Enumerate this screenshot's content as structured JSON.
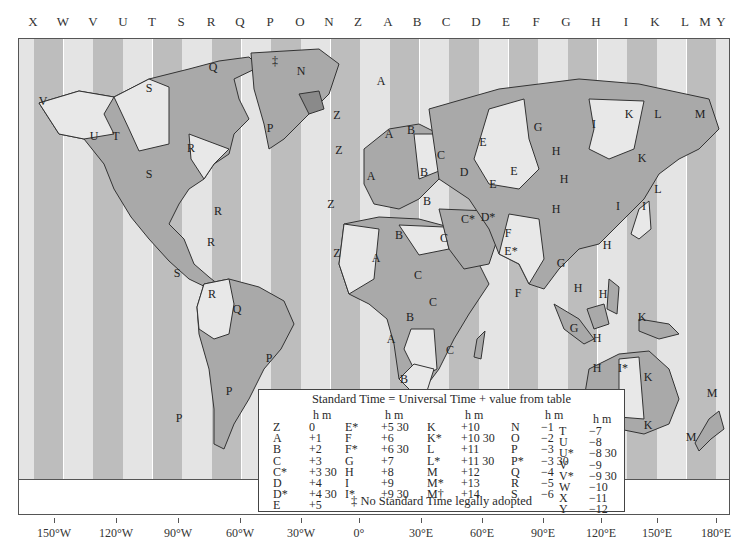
{
  "zone_letters": [
    {
      "letter": "X",
      "x": 33
    },
    {
      "letter": "W",
      "x": 63
    },
    {
      "letter": "V",
      "x": 93
    },
    {
      "letter": "U",
      "x": 123
    },
    {
      "letter": "T",
      "x": 152
    },
    {
      "letter": "S",
      "x": 181
    },
    {
      "letter": "R",
      "x": 211
    },
    {
      "letter": "Q",
      "x": 240
    },
    {
      "letter": "P",
      "x": 270
    },
    {
      "letter": "O",
      "x": 300
    },
    {
      "letter": "N",
      "x": 329
    },
    {
      "letter": "Z",
      "x": 358
    },
    {
      "letter": "A",
      "x": 388
    },
    {
      "letter": "B",
      "x": 417
    },
    {
      "letter": "C",
      "x": 446
    },
    {
      "letter": "D",
      "x": 476
    },
    {
      "letter": "E",
      "x": 506
    },
    {
      "letter": "F",
      "x": 536
    },
    {
      "letter": "G",
      "x": 566
    },
    {
      "letter": "H",
      "x": 596
    },
    {
      "letter": "I",
      "x": 626
    },
    {
      "letter": "K",
      "x": 655
    },
    {
      "letter": "L",
      "x": 685
    },
    {
      "letter": "M",
      "x": 705
    },
    {
      "letter": "Y",
      "x": 721
    }
  ],
  "colors": {
    "stripe_light": "#e4e4e4",
    "stripe_dark": "#bdbdbd",
    "land_dark": "#a9a9a9",
    "land_light": "#e8e8e8",
    "border": "#555555"
  },
  "land_labels": [
    {
      "t": "V",
      "x": 42,
      "y": 100
    },
    {
      "t": "U",
      "x": 93,
      "y": 135
    },
    {
      "t": "T",
      "x": 115,
      "y": 135
    },
    {
      "t": "S",
      "x": 148,
      "y": 87
    },
    {
      "t": "S",
      "x": 148,
      "y": 173
    },
    {
      "t": "R",
      "x": 190,
      "y": 147
    },
    {
      "t": "Q",
      "x": 212,
      "y": 66
    },
    {
      "t": "R",
      "x": 217,
      "y": 210
    },
    {
      "t": "R",
      "x": 210,
      "y": 241
    },
    {
      "t": "S",
      "x": 176,
      "y": 272
    },
    {
      "t": "R",
      "x": 211,
      "y": 293
    },
    {
      "t": "Q",
      "x": 236,
      "y": 308
    },
    {
      "t": "P",
      "x": 228,
      "y": 390
    },
    {
      "t": "P",
      "x": 268,
      "y": 357
    },
    {
      "t": "P",
      "x": 178,
      "y": 417
    },
    {
      "t": "‡",
      "x": 274,
      "y": 60
    },
    {
      "t": "N",
      "x": 300,
      "y": 70
    },
    {
      "t": "P",
      "x": 269,
      "y": 127
    },
    {
      "t": "A",
      "x": 380,
      "y": 80
    },
    {
      "t": "Z",
      "x": 336,
      "y": 114
    },
    {
      "t": "Z",
      "x": 338,
      "y": 149
    },
    {
      "t": "A",
      "x": 388,
      "y": 133
    },
    {
      "t": "B",
      "x": 410,
      "y": 129
    },
    {
      "t": "C",
      "x": 440,
      "y": 154
    },
    {
      "t": "E",
      "x": 482,
      "y": 141
    },
    {
      "t": "D",
      "x": 463,
      "y": 171
    },
    {
      "t": "E",
      "x": 492,
      "y": 183
    },
    {
      "t": "A",
      "x": 370,
      "y": 175
    },
    {
      "t": "B",
      "x": 423,
      "y": 171
    },
    {
      "t": "B",
      "x": 426,
      "y": 200
    },
    {
      "t": "Z",
      "x": 330,
      "y": 203
    },
    {
      "t": "C*",
      "x": 467,
      "y": 218
    },
    {
      "t": "D*",
      "x": 487,
      "y": 216
    },
    {
      "t": "C",
      "x": 443,
      "y": 237
    },
    {
      "t": "B",
      "x": 398,
      "y": 234
    },
    {
      "t": "Z",
      "x": 336,
      "y": 252
    },
    {
      "t": "A",
      "x": 375,
      "y": 257
    },
    {
      "t": "C",
      "x": 417,
      "y": 274
    },
    {
      "t": "C",
      "x": 432,
      "y": 301
    },
    {
      "t": "B",
      "x": 409,
      "y": 316
    },
    {
      "t": "A",
      "x": 390,
      "y": 338
    },
    {
      "t": "C",
      "x": 449,
      "y": 349
    },
    {
      "t": "B",
      "x": 403,
      "y": 378
    },
    {
      "t": "E",
      "x": 513,
      "y": 170
    },
    {
      "t": "F",
      "x": 507,
      "y": 232
    },
    {
      "t": "G",
      "x": 537,
      "y": 126
    },
    {
      "t": "H",
      "x": 555,
      "y": 150
    },
    {
      "t": "H",
      "x": 563,
      "y": 178
    },
    {
      "t": "I",
      "x": 593,
      "y": 123
    },
    {
      "t": "K",
      "x": 628,
      "y": 113
    },
    {
      "t": "L",
      "x": 657,
      "y": 113
    },
    {
      "t": "M",
      "x": 699,
      "y": 113
    },
    {
      "t": "K",
      "x": 641,
      "y": 157
    },
    {
      "t": "L",
      "x": 657,
      "y": 188
    },
    {
      "t": "H",
      "x": 555,
      "y": 208
    },
    {
      "t": "I",
      "x": 617,
      "y": 205
    },
    {
      "t": "I",
      "x": 643,
      "y": 205
    },
    {
      "t": "E*",
      "x": 510,
      "y": 250
    },
    {
      "t": "H",
      "x": 606,
      "y": 244
    },
    {
      "t": "F",
      "x": 517,
      "y": 292
    },
    {
      "t": "G",
      "x": 560,
      "y": 262
    },
    {
      "t": "H",
      "x": 577,
      "y": 287
    },
    {
      "t": "H",
      "x": 602,
      "y": 293
    },
    {
      "t": "K",
      "x": 641,
      "y": 316
    },
    {
      "t": "G",
      "x": 573,
      "y": 327
    },
    {
      "t": "H",
      "x": 596,
      "y": 337
    },
    {
      "t": "H",
      "x": 596,
      "y": 367
    },
    {
      "t": "I*",
      "x": 622,
      "y": 367
    },
    {
      "t": "K",
      "x": 647,
      "y": 376
    },
    {
      "t": "K",
      "x": 647,
      "y": 424
    },
    {
      "t": "M",
      "x": 711,
      "y": 392
    },
    {
      "t": "M",
      "x": 690,
      "y": 436
    }
  ],
  "legend": {
    "title": "Standard Time = Universal Time + value from table",
    "hm_label": "h m",
    "columns": [
      {
        "rows": [
          [
            "Z",
            "0"
          ],
          [
            "A",
            "+1"
          ],
          [
            "B",
            "+2"
          ],
          [
            "C",
            "+3"
          ],
          [
            "C*",
            "+3 30"
          ],
          [
            "D",
            "+4"
          ],
          [
            "D*",
            "+4 30"
          ],
          [
            "E",
            "+5"
          ]
        ]
      },
      {
        "rows": [
          [
            "E*",
            "+5 30"
          ],
          [
            "F",
            "+6"
          ],
          [
            "F*",
            "+6 30"
          ],
          [
            "G",
            "+7"
          ],
          [
            "H",
            "+8"
          ],
          [
            "I",
            "+9"
          ],
          [
            "I*",
            "+9 30"
          ]
        ]
      },
      {
        "rows": [
          [
            "K",
            "+10"
          ],
          [
            "K*",
            "+10 30"
          ],
          [
            "L",
            "+11"
          ],
          [
            "L*",
            "+11 30"
          ],
          [
            "M",
            "+12"
          ],
          [
            "M*",
            "+13"
          ],
          [
            "M†",
            "+14"
          ]
        ]
      },
      {
        "rows": [
          [
            "N",
            "−1"
          ],
          [
            "O",
            "−2"
          ],
          [
            "P",
            "−3"
          ],
          [
            "P*",
            "−3 30"
          ],
          [
            "Q",
            "−4"
          ],
          [
            "R",
            "−5"
          ],
          [
            "S",
            "−6"
          ]
        ]
      },
      {
        "rows": [
          [
            "T",
            "−7"
          ],
          [
            "U",
            "−8"
          ],
          [
            "U*",
            "−8 30"
          ],
          [
            "V",
            "−9"
          ],
          [
            "V*",
            "−9 30"
          ],
          [
            "W",
            "−10"
          ],
          [
            "X",
            "−11"
          ],
          [
            "Y",
            "−12"
          ]
        ]
      }
    ],
    "footnote": "‡ No Standard Time legally adopted"
  },
  "longitudes": [
    {
      "label": "150°W",
      "x": 54
    },
    {
      "label": "120°W",
      "x": 116
    },
    {
      "label": "90°W",
      "x": 178
    },
    {
      "label": "60°W",
      "x": 240
    },
    {
      "label": "30°W",
      "x": 301
    },
    {
      "label": "0°",
      "x": 359
    },
    {
      "label": "30°E",
      "x": 421
    },
    {
      "label": "60°E",
      "x": 482
    },
    {
      "label": "90°E",
      "x": 543
    },
    {
      "label": "120°E",
      "x": 601
    },
    {
      "label": "150°E",
      "x": 657
    },
    {
      "label": "180°E",
      "x": 716
    }
  ]
}
